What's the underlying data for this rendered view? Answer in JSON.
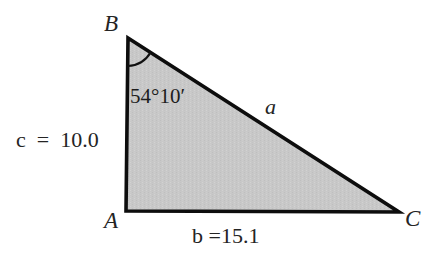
{
  "figure": {
    "type": "geometry-diagram",
    "shape": "triangle",
    "background_color": "#ffffff",
    "fill_color": "#c8c8c8",
    "stroke_color": "#000000",
    "text_color": "#242424",
    "vertices": {
      "B": {
        "label": "B",
        "x": 128,
        "y": 38
      },
      "A": {
        "label": "A",
        "x": 126,
        "y": 211
      },
      "C": {
        "label": "C",
        "x": 399,
        "y": 212
      }
    },
    "angle": {
      "at_vertex": "B",
      "label": "54°10′",
      "degrees": 54,
      "minutes": 10,
      "arc_radius": 28
    },
    "sides": {
      "a": {
        "label": "a",
        "opposite_vertex": "A",
        "from": "B",
        "to": "C",
        "value": null
      },
      "b": {
        "label": "b =15.1",
        "opposite_vertex": "B",
        "from": "A",
        "to": "C",
        "value": 15.1
      },
      "c": {
        "label": "c  =  10.0",
        "opposite_vertex": "C",
        "from": "A",
        "to": "B",
        "value": 10.0
      }
    }
  }
}
